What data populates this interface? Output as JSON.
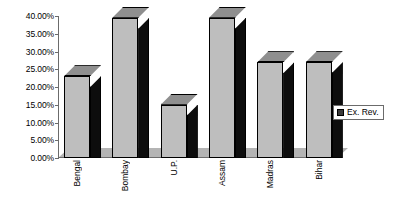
{
  "chart_data": {
    "type": "bar",
    "title": "",
    "subtitle": "",
    "xlabel": "",
    "ylabel": "",
    "categories": [
      "Bengal",
      "Bombay",
      "U.P.",
      "Assam",
      "Madras",
      "Bihar"
    ],
    "series": [
      {
        "name": "Ex. Rev.",
        "values": [
          23.0,
          39.5,
          15.0,
          39.5,
          27.0,
          27.0
        ]
      }
    ],
    "ylim": [
      0,
      40
    ],
    "ytick_values": [
      0,
      5,
      10,
      15,
      20,
      25,
      30,
      35,
      40
    ],
    "ytick_labels": [
      "0.00%",
      "5.00%",
      "10.00%",
      "15.00%",
      "20.00%",
      "25.00%",
      "30.00%",
      "35.00%",
      "40.00%"
    ],
    "grid": false,
    "legend_position": "right",
    "legend_entries": [
      "Ex. Rev."
    ],
    "style": "3d-column",
    "colors": {
      "bar_front": "#bebebe",
      "bar_side": "#0d0d0d",
      "bar_top": "#8f8f8f",
      "floor": "#b4b4b4",
      "axis": "#6b6b6b",
      "legend_swatch": "#3b3b3b",
      "background": "#ffffff",
      "text": "#000000"
    }
  },
  "legend": {
    "label": "Ex. Rev.",
    "swatch_name": "series-color-swatch"
  }
}
